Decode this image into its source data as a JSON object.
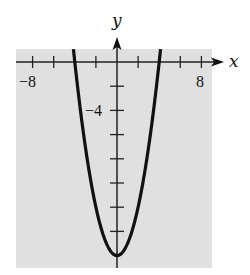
{
  "chart_data": {
    "type": "line",
    "title": "",
    "function": "y = x^2 - 16",
    "xlabel": "x",
    "ylabel": "y",
    "xlim": [
      -9.5,
      9
    ],
    "ylim": [
      -17,
      1
    ],
    "x_ticks": [
      -8,
      -6,
      -4,
      -2,
      2,
      4,
      6,
      8
    ],
    "y_ticks": [
      -2,
      -4,
      -6,
      -8,
      -10,
      -12,
      -14
    ],
    "x_tick_labels": [
      {
        "value": -8,
        "label": "−8"
      },
      {
        "value": 8,
        "label": "8"
      }
    ],
    "y_tick_labels": [
      {
        "value": -4,
        "label": "−4"
      }
    ],
    "grid": false,
    "background": "#e0e0e0",
    "series": [
      {
        "name": "parabola",
        "x": [
          -4.2,
          -4,
          -3,
          -2,
          -1,
          0,
          1,
          2,
          3,
          4,
          4.2
        ],
        "values": [
          1.64,
          0,
          -7,
          -12,
          -15,
          -16,
          -15,
          -12,
          -7,
          0,
          1.64
        ],
        "color": "#111111"
      }
    ],
    "vertex": [
      0,
      -16
    ],
    "x_intercepts": [
      -4,
      4
    ]
  },
  "labels": {
    "x_axis": "x",
    "y_axis": "y",
    "x_min_label": "−8",
    "x_max_label": "8",
    "y_label_neg4": "−4"
  }
}
